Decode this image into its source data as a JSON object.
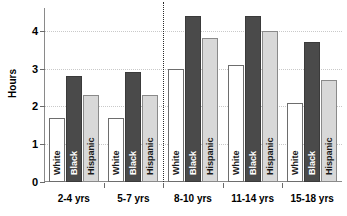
{
  "chart": {
    "ylabel": "Hours",
    "ytick_labels": [
      "0",
      "1",
      "2",
      "3",
      "4"
    ]
  },
  "chart_data": {
    "type": "bar",
    "title": "",
    "subtitle": "",
    "xlabel": "",
    "ylabel": "Hours",
    "ylim": [
      0,
      4.6
    ],
    "yticks": [
      0,
      1,
      2,
      3,
      4
    ],
    "grid": true,
    "legend_position": "none",
    "legend_entries": [
      "White",
      "Black",
      "Hispanic"
    ],
    "categories": [
      "2-4 yrs",
      "5-7 yrs",
      "8-10  yrs",
      "11-14 yrs",
      "15-18 yrs"
    ],
    "series": [
      {
        "name": "White",
        "values": [
          1.7,
          1.7,
          3.0,
          3.1,
          2.1
        ]
      },
      {
        "name": "Black",
        "values": [
          2.8,
          2.9,
          4.4,
          4.4,
          3.7
        ]
      },
      {
        "name": "Hispanic",
        "values": [
          2.3,
          2.3,
          3.8,
          4.0,
          2.7
        ]
      }
    ],
    "annotations": [
      {
        "type": "vertical-divider",
        "style": "dotted",
        "between": [
          "5-7 yrs",
          "8-10  yrs"
        ]
      }
    ],
    "colors": {
      "white_bar": "#ffffff",
      "black_bar": "#4a4a4a",
      "hispanic_bar": "#d8d8d8",
      "axis": "#8a8a8a",
      "gridline": "#c9c9c9",
      "divider": "#2b2b2b",
      "text": "#000000"
    }
  }
}
